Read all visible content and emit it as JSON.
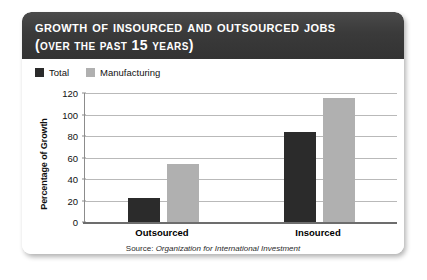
{
  "card": {
    "title_main": "Growth of Insourced and Outsourced Jobs",
    "title_sub": "(over the past 15 years)"
  },
  "source": {
    "prefix": "Source:",
    "organization": "Organization for International Investment"
  },
  "colors": {
    "header_bg": "#373737",
    "total": "#2b2b2b",
    "manufacturing": "#b0b0b0",
    "gridline": "#b9b9b9",
    "axis": "#6d6d6d"
  },
  "chart_data": {
    "type": "bar",
    "title": "Growth of Insourced and Outsourced Jobs (over the past 15 years)",
    "xlabel": "",
    "ylabel": "Percentage of Growth",
    "categories": [
      "Outsourced",
      "Insourced"
    ],
    "series": [
      {
        "name": "Total",
        "color": "#2b2b2b",
        "values": [
          22,
          84
        ]
      },
      {
        "name": "Manufacturing",
        "color": "#b0b0b0",
        "values": [
          54,
          115
        ]
      }
    ],
    "ylim": [
      0,
      120
    ],
    "yticks": [
      0,
      20,
      40,
      60,
      80,
      100,
      120
    ],
    "ytick_labels": [
      "0",
      "20",
      "40",
      "60",
      "80",
      "100",
      "120"
    ],
    "grid": true,
    "legend_position": "top-left"
  }
}
